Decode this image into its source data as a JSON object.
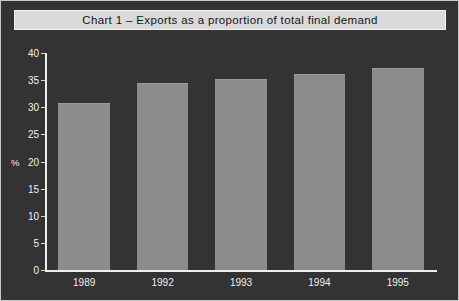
{
  "figure": {
    "title": "Chart 1 – Exports as a proportion of total final demand",
    "footnote": ""
  },
  "colors": {
    "background": "#333333",
    "bar": "#8c8c8c",
    "axis": "#efefef",
    "title_banner": "#d9d9d9",
    "title_text": "#151515",
    "tick_text": "#efefef"
  },
  "chart_data": {
    "type": "bar",
    "title": "Chart 1 – Exports as a proportion of total final demand",
    "xlabel": "",
    "ylabel": "%",
    "categories": [
      "1989",
      "1992",
      "1993",
      "1994",
      "1995"
    ],
    "values": [
      30.8,
      34.4,
      35.2,
      36.2,
      37.2
    ],
    "series": [
      {
        "name": "Exports as a proportion of total final demand",
        "values": [
          30.8,
          34.4,
          35.2,
          36.2,
          37.2
        ]
      }
    ],
    "ylim": [
      0,
      40
    ],
    "ytick_labels": [
      "40",
      "35",
      "30",
      "25",
      "20",
      "15",
      "10",
      "5",
      "0"
    ],
    "ytick_values": [
      40,
      35,
      30,
      25,
      20,
      15,
      10,
      5,
      0
    ],
    "ytick_step": 5,
    "grid": false,
    "legend": null,
    "legend_position": "none"
  }
}
